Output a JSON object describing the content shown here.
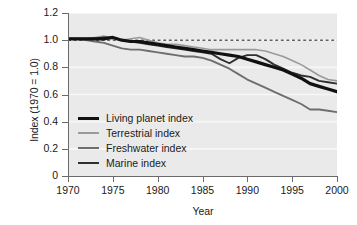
{
  "chart_data": {
    "type": "line",
    "title": "",
    "xlabel": "Year",
    "ylabel": "Index (1970 = 1.0)",
    "xlim": [
      1970,
      2000
    ],
    "ylim": [
      0,
      1.2
    ],
    "grid": true,
    "legend_position": "lower-left-inside",
    "reference_line": {
      "y": 1.0,
      "style": "dashed",
      "color": "#1a1a1a"
    },
    "xticks": [
      1970,
      1975,
      1980,
      1985,
      1990,
      1995,
      2000
    ],
    "xticklabels": [
      "1970",
      "1975",
      "1980",
      "1985",
      "1990",
      "1995",
      "2000"
    ],
    "yticks": [
      0,
      0.2,
      0.4,
      0.6,
      0.8,
      1.0,
      1.2
    ],
    "yticklabels": [
      "0",
      "0.2",
      "0.4",
      "0.6",
      "0.8",
      "1.0",
      "1.2"
    ],
    "x": [
      1970,
      1971,
      1972,
      1973,
      1974,
      1975,
      1976,
      1977,
      1978,
      1979,
      1980,
      1981,
      1982,
      1983,
      1984,
      1985,
      1986,
      1987,
      1988,
      1989,
      1990,
      1991,
      1992,
      1993,
      1994,
      1995,
      1996,
      1997,
      1998,
      1999,
      2000
    ],
    "series": [
      {
        "name": "Living planet index",
        "color": "#111111",
        "width": 3.2,
        "values": [
          1.01,
          1.01,
          1.01,
          1.01,
          1.01,
          1.02,
          1.0,
          0.99,
          0.99,
          0.98,
          0.97,
          0.96,
          0.95,
          0.94,
          0.93,
          0.92,
          0.91,
          0.9,
          0.89,
          0.88,
          0.86,
          0.84,
          0.82,
          0.8,
          0.78,
          0.75,
          0.72,
          0.68,
          0.66,
          0.64,
          0.62
        ]
      },
      {
        "name": "Terrestrial index",
        "color": "#9a9a9a",
        "width": 1.6,
        "values": [
          1.01,
          1.01,
          1.01,
          1.02,
          1.03,
          1.01,
          1.0,
          1.01,
          1.02,
          1.0,
          0.98,
          0.97,
          0.97,
          0.96,
          0.95,
          0.94,
          0.93,
          0.93,
          0.93,
          0.93,
          0.93,
          0.93,
          0.92,
          0.9,
          0.88,
          0.85,
          0.82,
          0.78,
          0.74,
          0.71,
          0.7
        ]
      },
      {
        "name": "Freshwater index",
        "color": "#6e6e6e",
        "width": 1.9,
        "values": [
          1.01,
          1.01,
          1.0,
          0.99,
          0.98,
          0.96,
          0.94,
          0.93,
          0.93,
          0.92,
          0.91,
          0.9,
          0.89,
          0.88,
          0.88,
          0.87,
          0.85,
          0.82,
          0.79,
          0.75,
          0.71,
          0.68,
          0.65,
          0.62,
          0.59,
          0.56,
          0.53,
          0.49,
          0.49,
          0.48,
          0.47
        ]
      },
      {
        "name": "Marine index",
        "color": "#2f2f2f",
        "width": 1.9,
        "values": [
          1.01,
          1.01,
          1.01,
          1.01,
          1.02,
          1.02,
          1.0,
          0.99,
          0.98,
          0.97,
          0.96,
          0.95,
          0.94,
          0.93,
          0.92,
          0.91,
          0.9,
          0.86,
          0.83,
          0.87,
          0.89,
          0.89,
          0.86,
          0.82,
          0.79,
          0.76,
          0.74,
          0.73,
          0.7,
          0.69,
          0.68
        ]
      }
    ]
  },
  "legend": {
    "items": [
      {
        "label": "Living planet index"
      },
      {
        "label": "Terrestrial index"
      },
      {
        "label": "Freshwater index"
      },
      {
        "label": "Marine index"
      }
    ]
  }
}
